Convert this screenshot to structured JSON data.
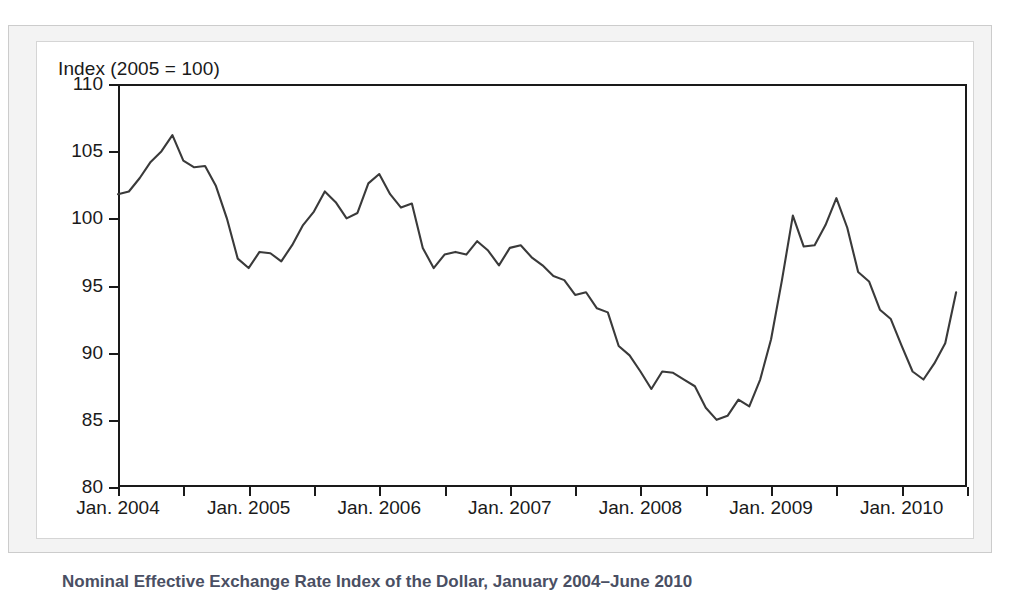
{
  "figure": {
    "y_axis_title": "Index (2005 = 100)",
    "caption": "Nominal Effective Exchange Rate Index of the Dollar, January 2004–June 2010",
    "line_color": "#3a3a3a",
    "axis_color": "#1a1a1a",
    "panel_background": "#ffffff",
    "mount_background": "#f3f3f3"
  },
  "chart_data": {
    "type": "line",
    "title": "Nominal Effective Exchange Rate Index of the Dollar, January 2004–June 2010",
    "xlabel": "",
    "ylabel": "Index (2005 = 100)",
    "ylim": [
      80,
      110
    ],
    "y_ticks": [
      80,
      85,
      90,
      95,
      100,
      105,
      110
    ],
    "y_tick_labels": [
      "80",
      "85",
      "90",
      "95",
      "100",
      "105",
      "110"
    ],
    "x_tick_labels": [
      "Jan. 2004",
      "Jan. 2005",
      "Jan. 2006",
      "Jan. 2007",
      "Jan. 2008",
      "Jan. 2009",
      "Jan. 2010"
    ],
    "x_major_tick_months": [
      0,
      12,
      24,
      36,
      48,
      60,
      72
    ],
    "x_minor_tick_months": [
      6,
      18,
      30,
      42,
      54,
      66,
      78
    ],
    "xlim_months": [
      0,
      78
    ],
    "grid": false,
    "legend": false,
    "series": [
      {
        "name": "Nominal effective exchange rate index of the dollar",
        "x": [
          "Jan. 2004",
          "Feb. 2004",
          "Mar. 2004",
          "Apr. 2004",
          "May 2004",
          "Jun. 2004",
          "Jul. 2004",
          "Aug. 2004",
          "Sep. 2004",
          "Oct. 2004",
          "Nov. 2004",
          "Dec. 2004",
          "Jan. 2005",
          "Feb. 2005",
          "Mar. 2005",
          "Apr. 2005",
          "May 2005",
          "Jun. 2005",
          "Jul. 2005",
          "Aug. 2005",
          "Sep. 2005",
          "Oct. 2005",
          "Nov. 2005",
          "Dec. 2005",
          "Jan. 2006",
          "Feb. 2006",
          "Mar. 2006",
          "Apr. 2006",
          "May 2006",
          "Jun. 2006",
          "Jul. 2006",
          "Aug. 2006",
          "Sep. 2006",
          "Oct. 2006",
          "Nov. 2006",
          "Dec. 2006",
          "Jan. 2007",
          "Feb. 2007",
          "Mar. 2007",
          "Apr. 2007",
          "May 2007",
          "Jun. 2007",
          "Jul. 2007",
          "Aug. 2007",
          "Sep. 2007",
          "Oct. 2007",
          "Nov. 2007",
          "Dec. 2007",
          "Jan. 2008",
          "Feb. 2008",
          "Mar. 2008",
          "Apr. 2008",
          "May 2008",
          "Jun. 2008",
          "Jul. 2008",
          "Aug. 2008",
          "Sep. 2008",
          "Oct. 2008",
          "Nov. 2008",
          "Dec. 2008",
          "Jan. 2009",
          "Feb. 2009",
          "Mar. 2009",
          "Apr. 2009",
          "May 2009",
          "Jun. 2009",
          "Jul. 2009",
          "Aug. 2009",
          "Sep. 2009",
          "Oct. 2009",
          "Nov. 2009",
          "Dec. 2009",
          "Jan. 2010",
          "Feb. 2010",
          "Mar. 2010",
          "Apr. 2010",
          "May 2010",
          "Jun. 2010"
        ],
        "values": [
          101.8,
          102.0,
          103.0,
          104.2,
          105.0,
          106.2,
          104.3,
          103.8,
          103.9,
          102.4,
          100.0,
          97.0,
          96.3,
          97.5,
          97.4,
          96.8,
          98.0,
          99.5,
          100.5,
          102.0,
          101.2,
          100.0,
          100.4,
          102.6,
          103.3,
          101.8,
          100.8,
          101.1,
          97.8,
          96.3,
          97.3,
          97.5,
          97.3,
          98.3,
          97.6,
          96.5,
          97.8,
          98.0,
          97.1,
          96.5,
          95.7,
          95.4,
          94.3,
          94.5,
          93.3,
          93.0,
          90.5,
          89.8,
          88.6,
          87.3,
          88.6,
          88.5,
          88.0,
          87.5,
          85.9,
          85.0,
          85.3,
          86.5,
          86.0,
          88.0,
          91.0,
          95.4,
          100.2,
          97.9,
          98.0,
          99.5,
          101.5,
          99.3,
          96.0,
          95.3,
          93.2,
          92.5,
          90.5,
          88.6,
          88.0,
          89.2,
          90.7,
          94.5
        ]
      }
    ]
  }
}
